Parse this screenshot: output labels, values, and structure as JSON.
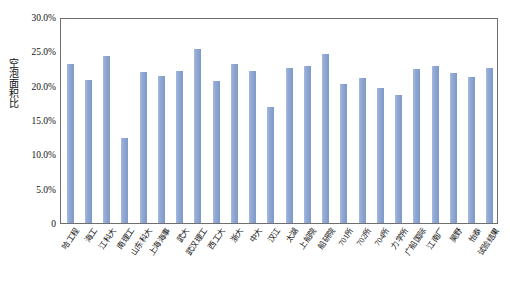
{
  "chart_data": {
    "type": "bar",
    "title": "",
    "xlabel": "",
    "ylabel": "空泡面积比",
    "ylim": [
      0,
      0.3
    ],
    "y_tick_labels": [
      "30.0%",
      "25.0%",
      "20.0%",
      "15.0%",
      "10.0%",
      "5.0%",
      "0"
    ],
    "y_tick_values": [
      0.3,
      0.25,
      0.2,
      0.15,
      0.1,
      0.05,
      0
    ],
    "grid": false,
    "legend": "none",
    "bar_color": "#8FA8D4",
    "axis_color": "#6F6F6F",
    "categories": [
      "哈工程",
      "海工",
      "江科大",
      "南理工",
      "山东科大",
      "上海海事",
      "武大",
      "武汉理工",
      "西工大",
      "浙大",
      "中大",
      "汉江",
      "太湖",
      "上船院",
      "船研院",
      "701所",
      "702所",
      "704所",
      "力学所",
      "广船国际",
      "江南厂",
      "昊野",
      "怡泰",
      "试验结果"
    ],
    "values": [
      0.232,
      0.208,
      0.243,
      0.124,
      0.22,
      0.214,
      0.221,
      0.254,
      0.207,
      0.232,
      0.222,
      0.169,
      0.226,
      0.229,
      0.246,
      0.202,
      0.211,
      0.196,
      0.187,
      0.224,
      0.229,
      0.218,
      0.213,
      0.226
    ],
    "series": [
      {
        "name": "空泡面积比",
        "values": [
          0.232,
          0.208,
          0.243,
          0.124,
          0.22,
          0.214,
          0.221,
          0.254,
          0.207,
          0.232,
          0.222,
          0.169,
          0.226,
          0.229,
          0.246,
          0.202,
          0.211,
          0.196,
          0.187,
          0.224,
          0.229,
          0.218,
          0.213,
          0.226
        ]
      }
    ]
  }
}
